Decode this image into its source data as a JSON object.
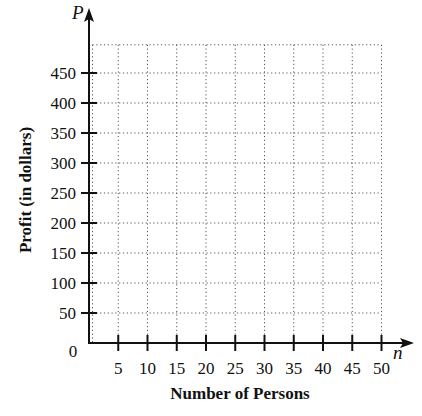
{
  "chart_data": {
    "type": "scatter",
    "title": "",
    "xlabel": "Number of Persons",
    "ylabel": "Profit (in dollars)",
    "x_variable": "n",
    "y_variable": "P",
    "origin_label": "0",
    "xlim": [
      0,
      50
    ],
    "ylim": [
      0,
      500
    ],
    "x_ticks": [
      5,
      10,
      15,
      20,
      25,
      30,
      35,
      40,
      45,
      50
    ],
    "y_ticks": [
      50,
      100,
      150,
      200,
      250,
      300,
      350,
      400,
      450
    ],
    "grid": true,
    "grid_style": "dotted",
    "series": [],
    "note": "Blank grid with no plotted data points"
  },
  "colors": {
    "axis": "#111111",
    "grid": "#555555",
    "background": "#ffffff"
  }
}
